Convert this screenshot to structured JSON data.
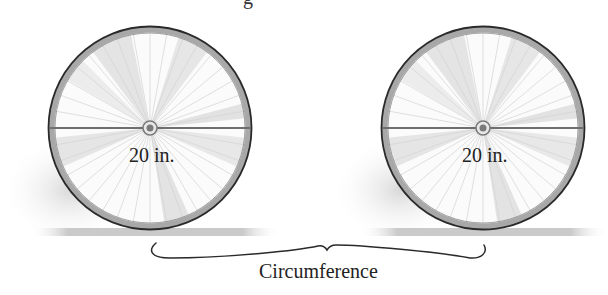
{
  "diagram": {
    "title_fragment": "g",
    "wheels": [
      {
        "id": "left",
        "cx": 150,
        "cy": 128,
        "r": 102,
        "diameter_label": "20 in."
      },
      {
        "id": "right",
        "cx": 483,
        "cy": 128,
        "r": 102,
        "diameter_label": "20 in."
      }
    ],
    "brace_label": "Circumference",
    "colors": {
      "tire_outer": "#2a2a2a",
      "tire_band": "#a8a8a8",
      "spoke": "#d0d0d0",
      "spoke_shade": "#e6e6e6",
      "diameter_line": "#6e6e6e",
      "hub": "#7a7a7a",
      "ground": "#c4c4c4",
      "text": "#222222"
    }
  }
}
